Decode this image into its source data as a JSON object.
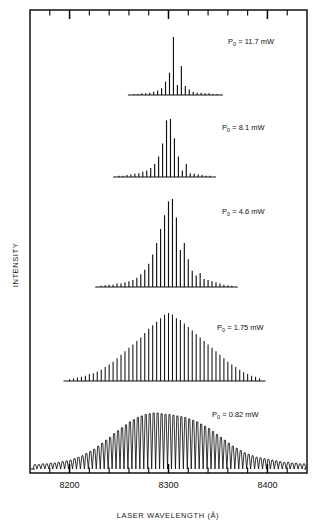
{
  "figure": {
    "ylabel": "INTENSITY",
    "xlabel": "LASER WAVELENGTH (Å)",
    "frame_color": "#000000",
    "trace_color": "#111111"
  },
  "axis": {
    "x_ticks_major": [
      {
        "value": 8200,
        "label": "8200"
      },
      {
        "value": 8300,
        "label": "8300"
      },
      {
        "value": 8400,
        "label": "8400"
      }
    ],
    "x_minor_step": 20,
    "x_range": [
      8160,
      8440
    ]
  },
  "traces": [
    {
      "label_p": "P",
      "label_sub": "0",
      "label_rest": "= 11.7 mW",
      "power_mW": 11.7
    },
    {
      "label_p": "P",
      "label_sub": "0",
      "label_rest": "= 8.1 mW",
      "power_mW": 8.1
    },
    {
      "label_p": "P",
      "label_sub": "0",
      "label_rest": "= 4.6 mW",
      "power_mW": 4.6
    },
    {
      "label_p": "P",
      "label_sub": "0",
      "label_rest": "= 1.75 mW",
      "power_mW": 1.75
    },
    {
      "label_p": "P",
      "label_sub": "0",
      "label_rest": "= 0.82 mW",
      "power_mW": 0.82
    }
  ],
  "chart_data": {
    "type": "line",
    "title": "",
    "xlabel": "LASER WAVELENGTH (Å)",
    "ylabel": "INTENSITY",
    "xlim": [
      8160,
      8440
    ],
    "grid": false,
    "legend": "inline-annotation",
    "series": [
      {
        "name": "P0 = 11.7 mW",
        "mode_spacing_A": 4.0,
        "center_A": 8300,
        "x": [
          8265,
          8269,
          8273,
          8277,
          8281,
          8285,
          8289,
          8293,
          8297,
          8301,
          8305,
          8309,
          8313,
          8317,
          8321,
          8325,
          8329,
          8333,
          8337,
          8341,
          8345,
          8349
        ],
        "values": [
          1,
          1,
          1.5,
          1.5,
          2,
          3,
          4,
          6,
          12,
          20,
          52,
          9,
          26,
          8,
          5,
          3,
          2,
          2,
          1.5,
          1.5,
          1,
          1
        ]
      },
      {
        "name": "P0 = 8.1 mW",
        "mode_spacing_A": 4.0,
        "center_A": 8298,
        "x": [
          8250,
          8254,
          8258,
          8262,
          8266,
          8270,
          8274,
          8278,
          8282,
          8286,
          8290,
          8294,
          8298,
          8302,
          8306,
          8310,
          8314,
          8318,
          8322,
          8326,
          8330,
          8334,
          8338,
          8342
        ],
        "values": [
          1,
          1,
          1.5,
          2,
          2.5,
          3,
          4,
          5,
          7,
          10,
          16,
          26,
          44,
          45,
          30,
          16,
          5,
          10,
          3,
          2.5,
          2,
          1.5,
          1,
          1
        ]
      },
      {
        "name": "P0 = 4.6 mW",
        "mode_spacing_A": 4.0,
        "center_A": 8300,
        "x": [
          8232,
          8236,
          8240,
          8244,
          8248,
          8252,
          8256,
          8260,
          8264,
          8268,
          8272,
          8276,
          8280,
          8284,
          8288,
          8292,
          8296,
          8300,
          8304,
          8308,
          8312,
          8316,
          8320,
          8324,
          8328,
          8332,
          8336,
          8340,
          8344,
          8348,
          8352,
          8356,
          8360,
          8364
        ],
        "values": [
          1,
          1.5,
          2,
          2,
          3,
          3,
          4,
          5,
          6,
          8,
          11,
          15,
          20,
          28,
          38,
          50,
          62,
          74,
          76,
          60,
          32,
          38,
          24,
          14,
          10,
          12,
          7,
          6,
          5,
          4,
          3,
          2,
          1.5,
          1
        ]
      },
      {
        "name": "P0 = 1.75 mW",
        "mode_spacing_A": 4.0,
        "center_A": 8300,
        "x": [
          8200,
          8204,
          8208,
          8212,
          8216,
          8220,
          8224,
          8228,
          8232,
          8236,
          8240,
          8244,
          8248,
          8252,
          8256,
          8260,
          8264,
          8268,
          8272,
          8276,
          8280,
          8284,
          8288,
          8292,
          8296,
          8300,
          8304,
          8308,
          8312,
          8316,
          8320,
          8324,
          8328,
          8332,
          8336,
          8340,
          8344,
          8348,
          8352,
          8356,
          8360,
          8364,
          8368,
          8372,
          8376,
          8380,
          8384,
          8388,
          8392
        ],
        "values": [
          2,
          3,
          4,
          5,
          6,
          8,
          9,
          11,
          13,
          16,
          19,
          22,
          26,
          30,
          34,
          38,
          42,
          46,
          50,
          55,
          60,
          64,
          68,
          72,
          76,
          78,
          76,
          72,
          70,
          66,
          62,
          58,
          54,
          50,
          46,
          42,
          38,
          34,
          30,
          26,
          22,
          19,
          16,
          13,
          10,
          8,
          6,
          5,
          3
        ]
      },
      {
        "name": "P0 = 0.82 mW",
        "mode_spacing_A": 4.0,
        "center_A": 8295,
        "x": [
          8165,
          8169,
          8173,
          8177,
          8181,
          8185,
          8189,
          8193,
          8197,
          8201,
          8205,
          8209,
          8213,
          8217,
          8221,
          8225,
          8229,
          8233,
          8237,
          8241,
          8245,
          8249,
          8253,
          8257,
          8261,
          8265,
          8269,
          8273,
          8277,
          8281,
          8285,
          8289,
          8293,
          8297,
          8301,
          8305,
          8309,
          8313,
          8317,
          8321,
          8325,
          8329,
          8333,
          8337,
          8341,
          8345,
          8349,
          8353,
          8357,
          8361,
          8365,
          8369,
          8373,
          8377,
          8381,
          8385,
          8389,
          8393,
          8397,
          8401,
          8405,
          8409,
          8413,
          8417,
          8421,
          8425,
          8429,
          8433,
          8437
        ],
        "values": [
          6,
          6,
          7,
          7,
          8,
          8,
          9,
          10,
          11,
          12,
          14,
          16,
          18,
          21,
          24,
          27,
          31,
          35,
          39,
          43,
          48,
          52,
          56,
          60,
          64,
          67,
          70,
          72,
          74,
          75,
          76,
          76,
          75,
          74,
          74,
          73,
          72,
          71,
          70,
          68,
          66,
          64,
          61,
          58,
          55,
          51,
          47,
          43,
          39,
          35,
          31,
          28,
          25,
          22,
          20,
          18,
          16,
          15,
          14,
          13,
          12,
          11,
          10,
          9,
          9,
          8,
          8,
          7,
          7
        ]
      }
    ]
  }
}
